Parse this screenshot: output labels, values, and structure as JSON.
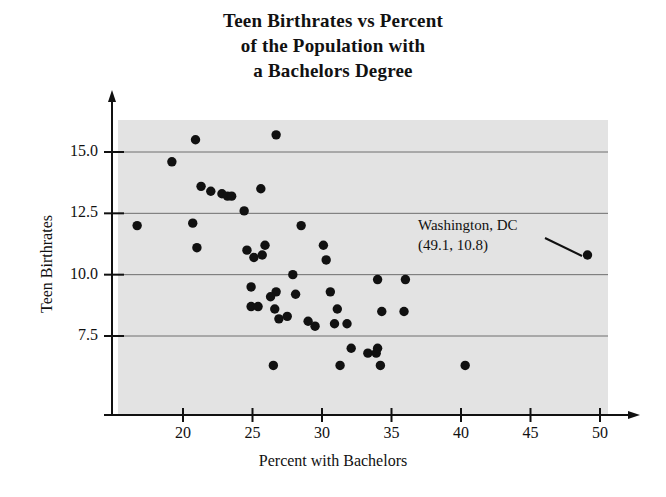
{
  "chart_data": {
    "type": "scatter",
    "title": "Teen Birthrates vs Percent of the Population with a Bachelors Degree",
    "title_lines": [
      "Teen Birthrates vs Percent",
      "of the Population with",
      "a Bachelors Degree"
    ],
    "xlabel": "Percent with Bachelors",
    "ylabel": "Teen Birthrates",
    "xlim": [
      15.5,
      52.0
    ],
    "ylim": [
      4.5,
      16.9
    ],
    "xticks": [
      20,
      25,
      30,
      35,
      40,
      45,
      50
    ],
    "xtick_labels": [
      "20",
      "25",
      "30",
      "35",
      "40",
      "45",
      "50"
    ],
    "yticks": [
      7.5,
      10.0,
      12.5,
      15.0
    ],
    "ytick_labels": [
      "7.5",
      "10.0",
      "12.5",
      "15.0"
    ],
    "grid": "horizontal",
    "legend": "none",
    "plot_bgcolor": "#e3e3e3",
    "marker_color": "#111111",
    "marker_size": 7,
    "points": [
      {
        "x": 16.7,
        "y": 12.0
      },
      {
        "x": 19.2,
        "y": 14.6
      },
      {
        "x": 20.9,
        "y": 15.5
      },
      {
        "x": 20.7,
        "y": 12.1
      },
      {
        "x": 21.3,
        "y": 13.6
      },
      {
        "x": 21.0,
        "y": 11.1
      },
      {
        "x": 22.0,
        "y": 13.4
      },
      {
        "x": 22.8,
        "y": 13.3
      },
      {
        "x": 23.2,
        "y": 13.2
      },
      {
        "x": 23.5,
        "y": 13.2
      },
      {
        "x": 24.6,
        "y": 11.0
      },
      {
        "x": 24.4,
        "y": 12.6
      },
      {
        "x": 25.1,
        "y": 10.7
      },
      {
        "x": 24.9,
        "y": 9.5
      },
      {
        "x": 24.9,
        "y": 8.7
      },
      {
        "x": 25.7,
        "y": 10.8
      },
      {
        "x": 25.4,
        "y": 8.7
      },
      {
        "x": 26.7,
        "y": 15.7
      },
      {
        "x": 25.6,
        "y": 13.5
      },
      {
        "x": 25.9,
        "y": 11.2
      },
      {
        "x": 26.7,
        "y": 9.3
      },
      {
        "x": 26.6,
        "y": 8.6
      },
      {
        "x": 26.5,
        "y": 6.3
      },
      {
        "x": 26.3,
        "y": 9.1
      },
      {
        "x": 26.9,
        "y": 8.2
      },
      {
        "x": 27.5,
        "y": 8.3
      },
      {
        "x": 27.9,
        "y": 10.0
      },
      {
        "x": 28.5,
        "y": 12.0
      },
      {
        "x": 28.1,
        "y": 9.2
      },
      {
        "x": 29.0,
        "y": 8.1
      },
      {
        "x": 29.5,
        "y": 7.9
      },
      {
        "x": 30.1,
        "y": 11.2
      },
      {
        "x": 30.6,
        "y": 9.3
      },
      {
        "x": 30.3,
        "y": 10.6
      },
      {
        "x": 31.1,
        "y": 8.6
      },
      {
        "x": 30.9,
        "y": 8.0
      },
      {
        "x": 31.8,
        "y": 8.0
      },
      {
        "x": 32.1,
        "y": 7.0
      },
      {
        "x": 31.3,
        "y": 6.3
      },
      {
        "x": 33.3,
        "y": 6.8
      },
      {
        "x": 33.9,
        "y": 6.8
      },
      {
        "x": 34.0,
        "y": 9.8
      },
      {
        "x": 34.3,
        "y": 8.5
      },
      {
        "x": 34.0,
        "y": 7.0
      },
      {
        "x": 34.2,
        "y": 6.3
      },
      {
        "x": 36.0,
        "y": 9.8
      },
      {
        "x": 35.9,
        "y": 8.5
      },
      {
        "x": 40.3,
        "y": 6.3
      },
      {
        "x": 49.1,
        "y": 10.8
      }
    ],
    "annotations": [
      {
        "lines": [
          "Washington, DC",
          "(49.1, 10.8)"
        ],
        "label": "Washington, DC",
        "value": "(49.1, 10.8)",
        "point": {
          "x": 49.1,
          "y": 10.8
        }
      }
    ]
  }
}
